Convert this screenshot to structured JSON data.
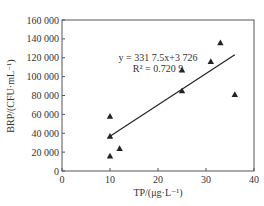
{
  "chart_data": {
    "type": "scatter",
    "title": "",
    "xlabel": "TP/(μg·L⁻¹)",
    "ylabel": "BRP/(CFU·mL⁻¹)",
    "xlim": [
      0,
      40
    ],
    "ylim": [
      0,
      160000
    ],
    "xticks": [
      0,
      10,
      20,
      30,
      40
    ],
    "xtick_labels": [
      "0",
      "10",
      "20",
      "30",
      "40"
    ],
    "yticks": [
      0,
      20000,
      40000,
      60000,
      80000,
      100000,
      120000,
      140000,
      160000
    ],
    "ytick_labels": [
      "0",
      "20 000",
      "40 000",
      "60 000",
      "80 000",
      "100 000",
      "120 000",
      "140 000",
      "160 000"
    ],
    "grid": false,
    "marker": "triangle",
    "series": [
      {
        "name": "BRP vs TP",
        "points": [
          {
            "x": 10,
            "y": 58000
          },
          {
            "x": 10,
            "y": 37000
          },
          {
            "x": 10,
            "y": 16000
          },
          {
            "x": 12,
            "y": 24000
          },
          {
            "x": 25,
            "y": 107000
          },
          {
            "x": 25,
            "y": 85000
          },
          {
            "x": 31,
            "y": 116000
          },
          {
            "x": 33,
            "y": 136000
          },
          {
            "x": 36,
            "y": 81000
          }
        ]
      }
    ],
    "fit": {
      "slope": 3317.5,
      "intercept": 3726,
      "x_range": [
        10,
        36
      ],
      "equation_text": "y = 331 7.5x+3 726",
      "r2_text": "R² = 0.720 9"
    }
  }
}
